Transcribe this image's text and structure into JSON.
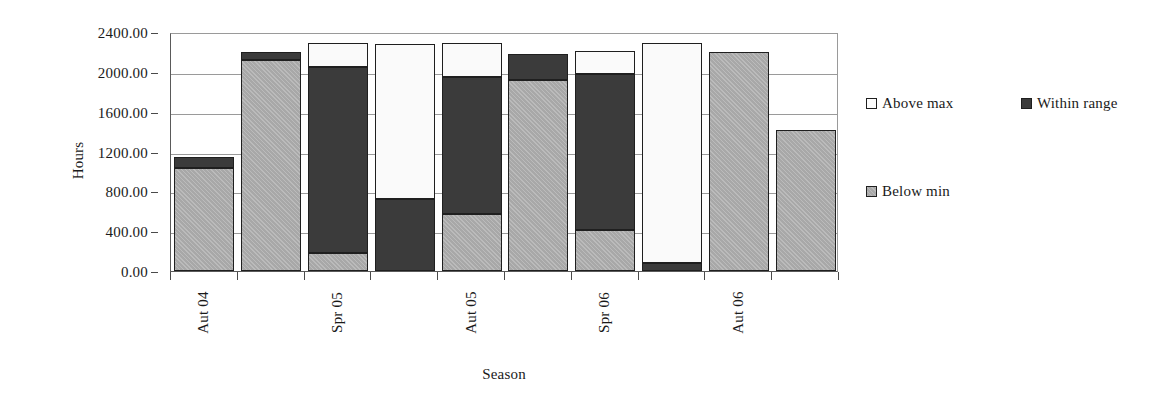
{
  "chart_data": {
    "type": "bar",
    "stacked": true,
    "title": "",
    "xlabel": "Season",
    "ylabel": "Hours",
    "ylim": [
      0,
      2400
    ],
    "ytick_step": 400,
    "ytick_labels": [
      "0.00",
      "400.00",
      "800.00",
      "1200.00",
      "1600.00",
      "2000.00",
      "2400.00"
    ],
    "ytick_values": [
      0,
      400,
      800,
      1200,
      1600,
      2000,
      2400
    ],
    "grid": true,
    "grid_axis": "y",
    "legend_position": "right",
    "categories": [
      "Aut 04",
      "",
      "Spr 05",
      "",
      "Aut 05",
      "",
      "Spr 06",
      "",
      "Aut 06",
      ""
    ],
    "visible_tick_labels": [
      "Aut 04",
      "Spr 05",
      "Aut 05",
      "Spr 06",
      "Aut 06"
    ],
    "bar_count": 10,
    "series": [
      {
        "name": "Below min",
        "color": "#a8a8a8",
        "values": [
          1030,
          2118,
          181,
          0,
          572,
          1918,
          412,
          0,
          2199,
          1416
        ]
      },
      {
        "name": "Within range",
        "color": "#3b3b3b",
        "values": [
          114,
          81,
          1868,
          723,
          1376,
          261,
          1566,
          80,
          0,
          0
        ]
      },
      {
        "name": "Above max",
        "color": "#fafafa",
        "values": [
          0,
          0,
          241,
          1556,
          341,
          0,
          231,
          2209,
          0,
          0
        ]
      }
    ],
    "stack_order": [
      "Below min",
      "Within range",
      "Above max"
    ],
    "bar_totals": [
      1144,
      2199,
      2290,
      2279,
      2289,
      2179,
      2209,
      2289,
      2199,
      1416
    ]
  },
  "legend": {
    "items": [
      {
        "label": "Above max",
        "swatch": "legend-swatch-above-max"
      },
      {
        "label": "Within range",
        "swatch": "legend-swatch-within-range"
      },
      {
        "label": "Below min",
        "swatch": "legend-swatch-below-min"
      }
    ]
  },
  "axes": {
    "y_title": "Hours",
    "x_title": "Season"
  }
}
